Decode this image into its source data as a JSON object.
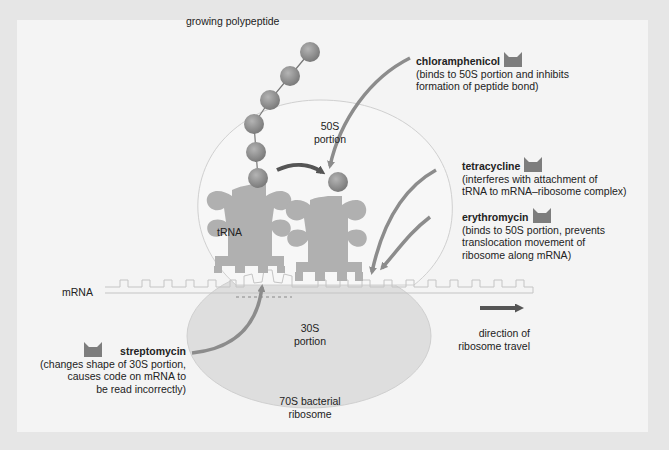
{
  "diagram": {
    "labels": {
      "growing_polypeptide": "growing polypeptide",
      "portion_50s_line1": "50S",
      "portion_50s_line2": "portion",
      "portion_30s_line1": "30S",
      "portion_30s_line2": "portion",
      "trna": "tRNA",
      "mrna": "mRNA",
      "ribosome_line1": "70S bacterial",
      "ribosome_line2": "ribosome",
      "direction_line1": "direction of",
      "direction_line2": "ribosome travel"
    },
    "drugs": [
      {
        "name": "chloramphenicol",
        "desc_lines": [
          "(binds to 50S portion and inhibits",
          "formation of peptide bond)"
        ],
        "icon": "drug-cup-icon"
      },
      {
        "name": "tetracycline",
        "desc_lines": [
          "(interferes with attachment of",
          "tRNA to mRNA–ribosome complex)"
        ],
        "icon": "drug-cup-icon"
      },
      {
        "name": "erythromycin",
        "desc_lines": [
          "(binds to 50S portion, prevents",
          "translocation movement of",
          "ribosome along mRNA)"
        ],
        "icon": "drug-cup-icon"
      },
      {
        "name": "streptomycin",
        "desc_lines": [
          "(changes shape of 30S portion,",
          "causes code on mRNA to",
          "be read incorrectly)"
        ],
        "icon": "drug-cup-icon"
      }
    ],
    "colors": {
      "background": "#e6e6e6",
      "panel": "#f4f4f4",
      "subunit_50s": "#f7f7f7",
      "subunit_30s": "#dedede",
      "amino_acid": "#8a8a8a",
      "trna": "#b0b0b0",
      "arrow": "#8c8c8c",
      "dark_arrow": "#555555",
      "drug_icon": "#7d7d7d"
    }
  }
}
